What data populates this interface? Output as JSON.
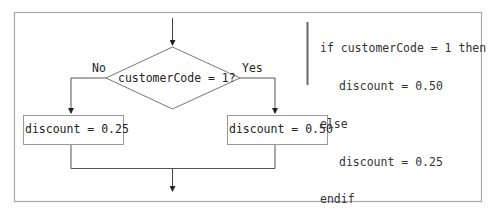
{
  "diagram": {
    "type": "flowchart",
    "decision": {
      "text": "customerCode = 1?",
      "no_label": "No",
      "yes_label": "Yes"
    },
    "left_process": {
      "text": "discount = 0.25"
    },
    "right_process": {
      "text": "discount = 0.50"
    },
    "pseudocode": {
      "lines": [
        {
          "text": "if customerCode = 1 then",
          "indent": 0
        },
        {
          "text": "discount = 0.50",
          "indent": 1
        },
        {
          "text": "else",
          "indent": 0
        },
        {
          "text": "discount = 0.25",
          "indent": 1
        },
        {
          "text": "endif",
          "indent": 0
        }
      ]
    },
    "colors": {
      "frame": "#a8a8a8",
      "lines": "#555555",
      "text": "#222222"
    }
  }
}
